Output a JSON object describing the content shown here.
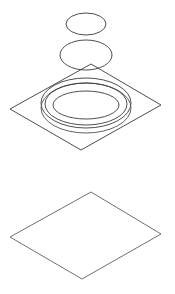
{
  "diagram": {
    "type": "exploded isometric line drawing",
    "background": "#ffffff",
    "colors": {
      "line_dark": "#3a3a3a",
      "line_mid": "#505050",
      "line_light": "#707070"
    },
    "components": [
      {
        "id": "top-disc",
        "shape": "ellipse",
        "cx": 86,
        "cy": 24,
        "rx": 20,
        "ry": 11
      },
      {
        "id": "middle-disc",
        "shape": "ellipse",
        "cx": 86,
        "cy": 55,
        "rx": 26,
        "ry": 15
      },
      {
        "id": "upper-plate",
        "shape": "diamond",
        "points": [
          [
            91,
            64
          ],
          [
            161,
            105
          ],
          [
            81,
            150
          ],
          [
            10,
            109
          ]
        ]
      },
      {
        "id": "ring-outer-top",
        "shape": "ellipse",
        "cx": 86,
        "cy": 103,
        "rx": 45,
        "ry": 25
      },
      {
        "id": "ring-outer-bottom",
        "shape": "ellipse",
        "cx": 86,
        "cy": 108,
        "rx": 45,
        "ry": 25
      },
      {
        "id": "ring-inner-rim",
        "shape": "ellipse",
        "cx": 86,
        "cy": 104,
        "rx": 41,
        "ry": 21
      },
      {
        "id": "ring-center-recess",
        "shape": "ellipse",
        "cx": 86,
        "cy": 105,
        "rx": 33,
        "ry": 14
      },
      {
        "id": "lower-plate",
        "shape": "diamond",
        "points": [
          [
            91,
            192
          ],
          [
            161,
            234
          ],
          [
            82,
            279
          ],
          [
            10,
            237
          ]
        ]
      }
    ]
  }
}
